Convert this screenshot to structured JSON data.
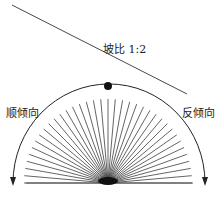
{
  "labels": {
    "slope": "坡比 1:2",
    "left": "顺倾向",
    "right": "反倾向"
  },
  "colors": {
    "line": "#333333",
    "background": "#ffffff"
  },
  "diagram": {
    "slope_line": {
      "x1": 12,
      "y1": 5,
      "x2": 187,
      "y2": 94
    },
    "arc": {
      "cx": 108,
      "cy": 183,
      "r": 98
    },
    "dot": {
      "cx": 108,
      "cy": 86,
      "r": 4
    },
    "ray_count": 36
  }
}
